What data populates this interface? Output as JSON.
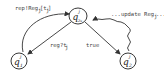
{
  "diagram": {
    "type": "state-machine",
    "nodes": [
      {
        "id": "center",
        "base": "q",
        "sup": "j",
        "sub": "2s"
      },
      {
        "id": "left",
        "base": "q",
        "sup": "j",
        "sub": "1"
      },
      {
        "id": "right",
        "base": "q",
        "sup": "j",
        "sub": "2"
      }
    ],
    "edges": [
      {
        "from": "left",
        "to": "center",
        "label": "rep!Reg",
        "label_sub": "j",
        "label_suffix": "[t",
        "label_suffix_sub": "j",
        "label_end": "]",
        "style": "solid-curved"
      },
      {
        "from": "center",
        "to": "left",
        "label": "reg?t",
        "label_sub": "j",
        "style": "solid"
      },
      {
        "from": "center",
        "to": "right",
        "label": "true",
        "style": "solid"
      },
      {
        "from": "right",
        "to": "center",
        "label": "...update Reg",
        "label_sub": "j",
        "label_end": "...",
        "style": "wavy"
      }
    ]
  }
}
